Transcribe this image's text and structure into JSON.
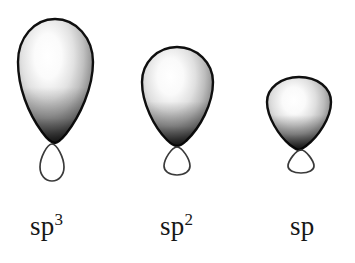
{
  "figure": {
    "background_color": "#ffffff",
    "width": 355,
    "height": 263,
    "outline_color": "#111111",
    "highlight_color": "#ffffff",
    "shade_color": "#4a4a4a",
    "small_lobe_stroke": "#3c3c3c"
  },
  "orbitals": [
    {
      "id": "sp3",
      "label_base": "sp",
      "label_exponent": "3",
      "name": "sp3-hybrid-orbital",
      "relative_size": "largest",
      "major_lobe": {
        "center_x": 55,
        "top_y": 19,
        "bottom_y": 143,
        "left_x": 18,
        "right_x": 93,
        "width": 75,
        "height": 124
      },
      "minor_lobe": {
        "center_x": 52,
        "top_y": 143,
        "bottom_y": 181,
        "width": 24,
        "height": 38
      }
    },
    {
      "id": "sp2",
      "label_base": "sp",
      "label_exponent": "2",
      "name": "sp2-hybrid-orbital",
      "relative_size": "medium",
      "major_lobe": {
        "center_x": 177,
        "top_y": 47,
        "bottom_y": 146,
        "left_x": 142,
        "right_x": 213,
        "width": 71,
        "height": 99
      },
      "minor_lobe": {
        "center_x": 177,
        "top_y": 146,
        "bottom_y": 174,
        "width": 27,
        "height": 28
      }
    },
    {
      "id": "sp",
      "label_base": "sp",
      "label_exponent": "",
      "name": "sp-hybrid-orbital",
      "relative_size": "smallest",
      "major_lobe": {
        "center_x": 299,
        "top_y": 77,
        "bottom_y": 149,
        "left_x": 267,
        "right_x": 331,
        "width": 64,
        "height": 72
      },
      "minor_lobe": {
        "center_x": 301,
        "top_y": 149,
        "bottom_y": 169,
        "width": 28,
        "height": 20
      }
    }
  ],
  "labels": {
    "sp3": {
      "base": "sp",
      "exponent": "3"
    },
    "sp2": {
      "base": "sp",
      "exponent": "2"
    },
    "sp": {
      "base": "sp",
      "exponent": ""
    }
  }
}
